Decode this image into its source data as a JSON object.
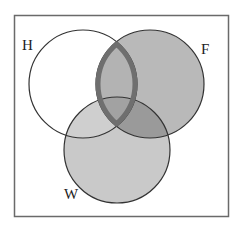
{
  "diagram": {
    "type": "venn",
    "sets": [
      {
        "id": "H",
        "label": "H",
        "cx": 83,
        "cy": 84,
        "r": 54,
        "fill": "#ffffff"
      },
      {
        "id": "F",
        "label": "F",
        "cx": 150,
        "cy": 84,
        "r": 54,
        "fill": "#b9b9b9"
      },
      {
        "id": "W",
        "label": "W",
        "cx": 117,
        "cy": 150,
        "r": 53,
        "fill": "#c9c9c9"
      }
    ],
    "highlighted_region": {
      "sets": [
        "H",
        "F"
      ],
      "stroke": "#6f6f6f"
    },
    "colors": {
      "frame": "#6a6a6a",
      "circle_stroke": "#333333",
      "h_and_f": "#b0b0b0",
      "f_and_w": "#9a9a9a",
      "h_and_w": "#cfcfcf",
      "all_three": "#a2a2a2"
    }
  }
}
